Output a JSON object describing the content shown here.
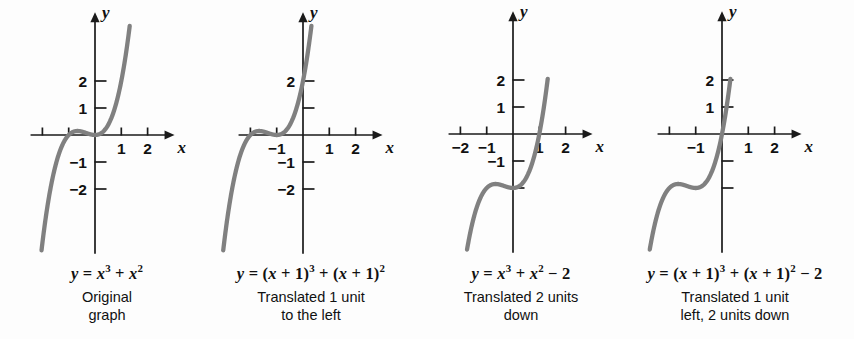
{
  "figure": {
    "background_color": "#fdfdfd",
    "curve_color": "#808080",
    "axis_color": "#1a1a1a",
    "text_color": "#111111"
  },
  "panels": [
    {
      "id": "original",
      "equation_html": "<i>y</i> = <i>x</i><sup>3</sup> + <i>x</i><sup>2</sup>",
      "equation_text": "y = x^3 + x^2",
      "desc_line1": "Original",
      "desc_line2": "graph",
      "axis": {
        "x_label": "x",
        "y_label": "y",
        "x_ticks": [
          -2,
          -1,
          1,
          2
        ],
        "y_ticks": [
          2,
          1,
          -1,
          -2
        ],
        "x_tick_labels": [
          "",
          "",
          "1",
          "2"
        ],
        "y_tick_labels": [
          "2",
          "1",
          "−1",
          "−2"
        ]
      }
    },
    {
      "id": "left1",
      "equation_html": "<i>y</i> = (<i>x</i> + 1)<sup>3</sup> + (<i>x</i> + 1)<sup>2</sup>",
      "equation_text": "y = (x + 1)^3 + (x + 1)^2",
      "desc_line1": "Translated 1 unit",
      "desc_line2": "to the left",
      "axis": {
        "x_label": "x",
        "y_label": "y",
        "x_ticks": [
          -2,
          -1,
          1,
          2
        ],
        "y_ticks": [
          2,
          1,
          -1,
          -2
        ],
        "x_tick_labels": [
          "",
          "−1",
          "1",
          "2"
        ],
        "y_tick_labels": [
          "2",
          "",
          "−1",
          "−2"
        ]
      }
    },
    {
      "id": "down2",
      "equation_html": "<i>y</i> = <i>x</i><sup>3</sup> + <i>x</i><sup>2</sup> − 2",
      "equation_text": "y = x^3 + x^2 - 2",
      "desc_line1": "Translated 2 units",
      "desc_line2": "down",
      "axis": {
        "x_label": "x",
        "y_label": "y",
        "x_ticks": [
          -2,
          -1,
          1,
          2
        ],
        "y_ticks": [
          2,
          1,
          -1,
          -2
        ],
        "x_tick_labels": [
          "−2",
          "−1",
          "1",
          "2"
        ],
        "y_tick_labels": [
          "2",
          "1",
          "−1",
          ""
        ]
      }
    },
    {
      "id": "left1down2",
      "equation_html": "<i>y</i> = (<i>x</i> + 1)<sup>3</sup> + (<i>x</i> + 1)<sup>2</sup> − 2",
      "equation_text": "y = (x + 1)^3 + (x + 1)^2 - 2",
      "desc_line1": "Translated 1 unit",
      "desc_line2": "left, 2 units down",
      "axis": {
        "x_label": "x",
        "y_label": "y",
        "x_ticks": [
          -2,
          -1,
          1,
          2
        ],
        "y_ticks": [
          2,
          1,
          -1,
          -2
        ],
        "x_tick_labels": [
          "",
          "−1",
          "1",
          "2"
        ],
        "y_tick_labels": [
          "2",
          "1",
          "",
          ""
        ]
      }
    }
  ],
  "chart_data": {
    "type": "line",
    "xlabel": "x",
    "ylabel": "y",
    "xlim": [
      -2.4,
      2.6
    ],
    "ylim": [
      -3.6,
      3.4
    ],
    "grid": false,
    "legend": "none",
    "unit_px_x": 26.3,
    "unit_px_y": 27.0,
    "series": [
      {
        "name": "y = x^3 + x^2",
        "panel": "original",
        "formula": "x**3 + x**2",
        "shift_x": 0,
        "shift_y": 0,
        "origin_px": [
          95,
          135
        ],
        "key_points": [
          {
            "x": -1.0,
            "y": 0.0
          },
          {
            "x": -0.667,
            "y": 0.148
          },
          {
            "x": 0.0,
            "y": 0.0
          },
          {
            "x": 1.0,
            "y": 2.0
          }
        ]
      },
      {
        "name": "y = (x + 1)^3 + (x + 1)^2",
        "panel": "left1",
        "formula": "(x+1)**3 + (x+1)**2",
        "shift_x": -1,
        "shift_y": 0,
        "origin_px": [
          303,
          135
        ],
        "key_points": [
          {
            "x": -2.0,
            "y": 0.0
          },
          {
            "x": -1.667,
            "y": 0.148
          },
          {
            "x": -1.0,
            "y": 0.0
          },
          {
            "x": 0.0,
            "y": 2.0
          }
        ]
      },
      {
        "name": "y = x^3 + x^2 - 2",
        "panel": "down2",
        "formula": "x**3 + x**2 - 2",
        "shift_x": 0,
        "shift_y": -2,
        "origin_px": [
          513,
          134
        ],
        "key_points": [
          {
            "x": -1.0,
            "y": -2.0
          },
          {
            "x": -0.667,
            "y": -1.852
          },
          {
            "x": 0.0,
            "y": -2.0
          },
          {
            "x": 1.0,
            "y": 0.0
          }
        ]
      },
      {
        "name": "y = (x + 1)^3 + (x + 1)^2 - 2",
        "panel": "left1down2",
        "formula": "(x+1)**3 + (x+1)**2 - 2",
        "shift_x": -1,
        "shift_y": -2,
        "origin_px": [
          722,
          134
        ],
        "key_points": [
          {
            "x": -2.0,
            "y": -2.0
          },
          {
            "x": -1.667,
            "y": -1.852
          },
          {
            "x": -1.0,
            "y": -2.0
          },
          {
            "x": 0.0,
            "y": 0.0
          }
        ]
      }
    ]
  }
}
